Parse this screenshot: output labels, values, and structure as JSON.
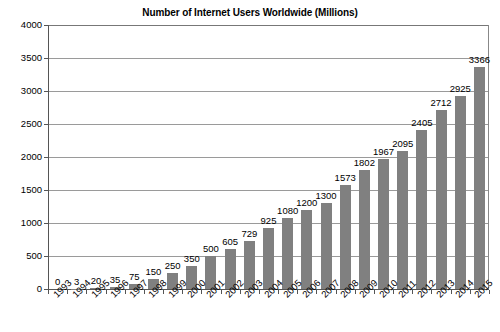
{
  "chart_data": {
    "type": "bar",
    "title": "Number of Internet Users Worldwide (Millions)",
    "xlabel": "",
    "ylabel": "",
    "ylim": [
      0,
      4000
    ],
    "ytick_step": 500,
    "yticks": [
      "0",
      "500",
      "1000",
      "1500",
      "2000",
      "2500",
      "3000",
      "3500",
      "4000"
    ],
    "grid": true,
    "legend": "none",
    "bar_color": "#808080",
    "show_value_labels": true,
    "categories": [
      "1993",
      "1994",
      "1995",
      "1996",
      "1997",
      "1998",
      "1999",
      "2000",
      "2001",
      "2002",
      "2003",
      "2004",
      "2005",
      "2006",
      "2007",
      "2008",
      "2009",
      "2010",
      "2011",
      "2012",
      "2013",
      "2014",
      "2015"
    ],
    "values": [
      0,
      3,
      20,
      35,
      75,
      150,
      250,
      350,
      500,
      605,
      729,
      925,
      1080,
      1200,
      1300,
      1573,
      1802,
      1967,
      2095,
      2405,
      2712,
      2925,
      3366
    ],
    "value_labels": [
      "0",
      "3",
      "20",
      "35",
      "75",
      "150",
      "250",
      "350",
      "500",
      "605",
      "729",
      "925",
      "1080",
      "1200",
      "1300",
      "1573",
      "1802",
      "1967",
      "2095",
      "2405",
      "2712",
      "2925",
      "3366"
    ]
  }
}
